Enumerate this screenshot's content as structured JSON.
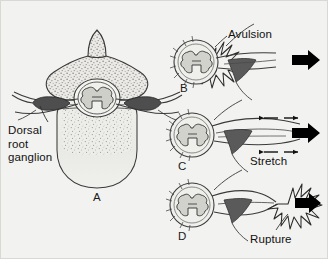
{
  "figure": {
    "background_color": "#f2f2f0",
    "ink_color": "#2b2b2b",
    "arrow_color": "#000000",
    "shade_color": "#6e6e6e"
  },
  "labels": {
    "dorsal_root_ganglion": "Dorsal\nroot\nganglion",
    "avulsion": "Avulsion",
    "stretch": "Stretch",
    "rupture": "Rupture"
  },
  "panels": [
    {
      "letter": "A",
      "name": "normal-vertebra-cross-section",
      "description": "Axial cross-section of a cervical vertebra with spinal cord in the canal and dorsal root ganglion on the nerve root",
      "callout": "Dorsal root ganglion",
      "injury": null,
      "has_traction_arrow": false
    },
    {
      "letter": "B",
      "name": "avulsion-panel",
      "description": "Nerve rootlets torn directly off the spinal cord at the cord surface",
      "callout": "Avulsion",
      "injury": "avulsion",
      "has_traction_arrow": true,
      "burst_location": "at-spinal-cord"
    },
    {
      "letter": "C",
      "name": "stretch-panel",
      "description": "Nerve elongated under tension without discontinuity",
      "callout": "Stretch",
      "injury": "stretch",
      "has_traction_arrow": true,
      "tension_arrow_pairs": 2
    },
    {
      "letter": "D",
      "name": "rupture-panel",
      "description": "Nerve torn through distal to the ganglion, away from the cord",
      "callout": "Rupture",
      "injury": "rupture",
      "has_traction_arrow": true,
      "burst_location": "distal-to-ganglion"
    }
  ],
  "diagram_data": {
    "type": "anatomical-diagram",
    "panel_count": 4,
    "panel_letters": [
      "A",
      "B",
      "C",
      "D"
    ],
    "traction_arrow_count": 3,
    "traction_arrow_direction": "right",
    "tension_arrow_count": 4
  }
}
